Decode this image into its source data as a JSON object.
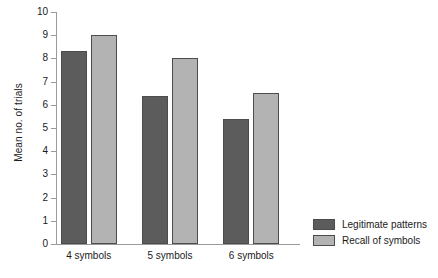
{
  "chart_data": {
    "type": "bar",
    "title": "",
    "xlabel": "",
    "ylabel": "Mean no. of trials",
    "ylim": [
      0,
      10
    ],
    "ytick_step": 1,
    "yticks": [
      10,
      9,
      8,
      7,
      6,
      5,
      4,
      3,
      2,
      1,
      0
    ],
    "grid": false,
    "legend_position": "right-bottom",
    "categories": [
      "4 symbols",
      "5 symbols",
      "6 symbols"
    ],
    "series": [
      {
        "name": "Legitimate patterns",
        "color": "#5c5c5c",
        "values": [
          8.3,
          6.4,
          5.4
        ]
      },
      {
        "name": "Recall of symbols",
        "color": "#b3b3b3",
        "values": [
          9.0,
          8.0,
          6.5
        ]
      }
    ]
  },
  "colors": {
    "series_dark": "#5c5c5c",
    "series_light": "#b3b3b3",
    "axis": "#9a9a9a",
    "bar_border": "#4c4c4c",
    "text": "#1a1a1a",
    "background": "#ffffff"
  }
}
